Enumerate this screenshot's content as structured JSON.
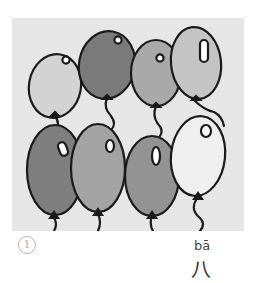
{
  "illustration": {
    "subject": "balloons",
    "balloon_count": 8,
    "colors": {
      "panel_bg": "#e6e6e6",
      "white": "#f2f2f2",
      "light": "#c9c9c9",
      "medium": "#a9a9a9",
      "dark": "#7a7a7a",
      "outline": "#1a1a1a"
    }
  },
  "caption": {
    "index": "1",
    "pinyin": "bā",
    "hanzi": "八"
  }
}
